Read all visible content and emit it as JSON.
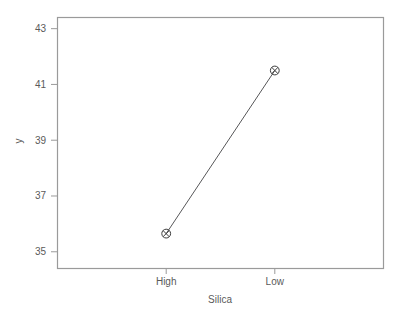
{
  "chart_data": {
    "type": "line",
    "title": "",
    "subtitle": "",
    "xlabel": "Silica",
    "ylabel": "y",
    "categories": [
      "High",
      "Low"
    ],
    "values": [
      35.65,
      41.5
    ],
    "series": [
      {
        "name": "y",
        "values": [
          35.65,
          41.5
        ]
      }
    ],
    "ylim": [
      34.4,
      43.4
    ],
    "yticks": [
      35,
      37,
      39,
      41,
      43
    ],
    "ytick_labels": [
      "35",
      "37",
      "39",
      "41",
      "43"
    ],
    "xtick_labels": [
      "High",
      "Low"
    ],
    "grid": false,
    "legend": false,
    "legend_position": "none",
    "marker": "circle-with-x",
    "line_color": "#58585a",
    "marker_color": "#3a3a3a",
    "frame_color": "#9a9a9a",
    "background": "#ffffff",
    "annotations": []
  },
  "axes": {
    "y_title": "y",
    "x_title": "Silica",
    "y_tick_0": "35",
    "y_tick_1": "37",
    "y_tick_2": "39",
    "y_tick_3": "41",
    "y_tick_4": "43",
    "x_cat_0": "High",
    "x_cat_1": "Low"
  }
}
